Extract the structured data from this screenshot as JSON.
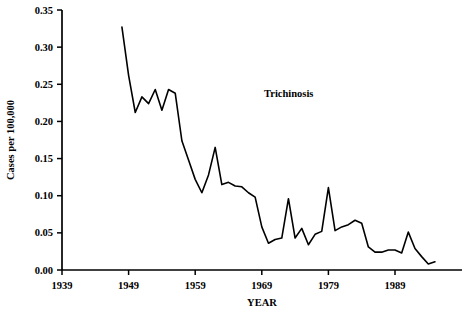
{
  "chart_data": {
    "type": "line",
    "title": "",
    "annotation": "Trichinosis",
    "xlabel": "YEAR",
    "ylabel": "Cases per 100,000",
    "xlim": [
      1939,
      1996
    ],
    "ylim": [
      0.0,
      0.35
    ],
    "grid": false,
    "legend_position": "none",
    "xticks": [
      1939,
      1949,
      1959,
      1969,
      1979,
      1989
    ],
    "xtick_labels": [
      "1939",
      "1949",
      "1959",
      "1969",
      "1979",
      "1989"
    ],
    "yticks": [
      0.0,
      0.05,
      0.1,
      0.15,
      0.2,
      0.25,
      0.3,
      0.35
    ],
    "ytick_labels": [
      "0.00",
      "0.05",
      "0.10",
      "0.15",
      "0.20",
      "0.25",
      "0.30",
      "0.35"
    ],
    "line_color": "#000000",
    "line_width": 1.6,
    "series": [
      {
        "name": "Trichinosis",
        "x": [
          1948,
          1949,
          1950,
          1951,
          1952,
          1953,
          1954,
          1955,
          1956,
          1957,
          1958,
          1959,
          1960,
          1961,
          1962,
          1963,
          1964,
          1965,
          1966,
          1967,
          1968,
          1969,
          1970,
          1971,
          1972,
          1973,
          1974,
          1975,
          1976,
          1977,
          1978,
          1979,
          1980,
          1981,
          1982,
          1983,
          1984,
          1985,
          1986,
          1987,
          1988,
          1989,
          1990,
          1991,
          1992,
          1993,
          1994,
          1995
        ],
        "values": [
          0.327,
          0.262,
          0.212,
          0.233,
          0.224,
          0.243,
          0.215,
          0.243,
          0.238,
          0.174,
          0.148,
          0.122,
          0.104,
          0.128,
          0.165,
          0.115,
          0.118,
          0.113,
          0.112,
          0.104,
          0.098,
          0.058,
          0.036,
          0.041,
          0.043,
          0.096,
          0.043,
          0.056,
          0.034,
          0.048,
          0.052,
          0.111,
          0.053,
          0.058,
          0.061,
          0.067,
          0.063,
          0.031,
          0.024,
          0.024,
          0.027,
          0.027,
          0.023,
          0.051,
          0.029,
          0.018,
          0.008,
          0.011
        ]
      }
    ]
  },
  "axes": {
    "xlabel": "YEAR",
    "ylabel": "Cases per 100,000"
  },
  "annotations": {
    "series_label": "Trichinosis"
  }
}
